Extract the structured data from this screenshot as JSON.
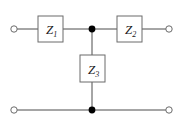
{
  "diagram": {
    "type": "schematic",
    "background_color": "#ffffff",
    "wire_color": "#4d4d4d",
    "box_stroke_color": "#666666",
    "node_color": "#000000",
    "label_color": "#1a1a1a",
    "components": [
      {
        "id": "z1",
        "label_main": "Z",
        "label_sub": "1",
        "kind": "series-impedance",
        "box": {
          "x": 38,
          "y": 16,
          "w": 25,
          "h": 26
        }
      },
      {
        "id": "z2",
        "label_main": "Z",
        "label_sub": "2",
        "kind": "series-impedance",
        "box": {
          "x": 117,
          "y": 16,
          "w": 25,
          "h": 26
        }
      },
      {
        "id": "z3",
        "label_main": "Z",
        "label_sub": "3",
        "kind": "shunt-impedance",
        "box": {
          "x": 80,
          "y": 55,
          "w": 25,
          "h": 27
        }
      }
    ],
    "terminals": [
      {
        "id": "in-top",
        "x": 14,
        "y": 29,
        "r": 3.2,
        "style": "open-circle"
      },
      {
        "id": "out-top",
        "x": 169,
        "y": 29,
        "r": 3.2,
        "style": "open-circle"
      },
      {
        "id": "in-bottom",
        "x": 14,
        "y": 110,
        "r": 3.2,
        "style": "open-circle"
      },
      {
        "id": "out-bottom",
        "x": 169,
        "y": 110,
        "r": 3.2,
        "style": "open-circle"
      }
    ],
    "junctions": [
      {
        "id": "node-top",
        "x": 92,
        "y": 29,
        "r": 3.4,
        "style": "filled-dot"
      },
      {
        "id": "node-bottom",
        "x": 92,
        "y": 110,
        "r": 3.4,
        "style": "filled-dot"
      }
    ],
    "wires": [
      {
        "id": "wire-in-to-z1",
        "x1": 17,
        "y1": 29,
        "x2": 38,
        "y2": 29
      },
      {
        "id": "wire-z1-to-node",
        "x1": 63,
        "y1": 29,
        "x2": 92,
        "y2": 29
      },
      {
        "id": "wire-node-to-z2",
        "x1": 92,
        "y1": 29,
        "x2": 117,
        "y2": 29
      },
      {
        "id": "wire-z2-to-out",
        "x1": 142,
        "y1": 29,
        "x2": 166,
        "y2": 29
      },
      {
        "id": "wire-node-to-z3",
        "x1": 92,
        "y1": 29,
        "x2": 92,
        "y2": 55
      },
      {
        "id": "wire-z3-to-rail",
        "x1": 92,
        "y1": 82,
        "x2": 92,
        "y2": 110
      },
      {
        "id": "wire-bottom-left",
        "x1": 17,
        "y1": 110,
        "x2": 92,
        "y2": 110
      },
      {
        "id": "wire-bottom-right",
        "x1": 92,
        "y1": 110,
        "x2": 166,
        "y2": 110
      }
    ]
  }
}
